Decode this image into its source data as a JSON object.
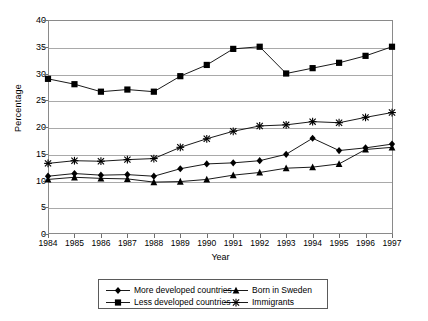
{
  "chart_data": {
    "type": "line",
    "title": "",
    "xlabel": "Year",
    "ylabel": "Percentage",
    "categories": [
      "1984",
      "1985",
      "1986",
      "1987",
      "1988",
      "1989",
      "1990",
      "1991",
      "1992",
      "1993",
      "1994",
      "1995",
      "1996",
      "1997"
    ],
    "ylim": [
      0,
      40
    ],
    "ytick_values": [
      0,
      5,
      10,
      15,
      20,
      25,
      30,
      35,
      40
    ],
    "ytick_labels": [
      "0",
      "5",
      "10",
      "15",
      "20",
      "25",
      "30",
      "35",
      "40"
    ],
    "grid": true,
    "legend_position": "bottom",
    "series": [
      {
        "name": "More developed countries",
        "marker": "diamond",
        "values": [
          10.8,
          11.3,
          11.0,
          11.1,
          10.8,
          12.2,
          13.1,
          13.3,
          13.7,
          14.9,
          17.9,
          15.6,
          16.1,
          16.8
        ]
      },
      {
        "name": "Less developed countries",
        "marker": "square",
        "values": [
          29.0,
          28.0,
          26.6,
          27.0,
          26.6,
          29.5,
          31.6,
          34.6,
          35.0,
          30.0,
          31.0,
          32.0,
          33.3,
          35.0
        ]
      },
      {
        "name": "Born in Sweden",
        "marker": "triangle",
        "values": [
          10.2,
          10.6,
          10.4,
          10.3,
          9.7,
          9.8,
          10.2,
          11.0,
          11.5,
          12.3,
          12.5,
          13.1,
          15.8,
          16.2
        ]
      },
      {
        "name": "Immigrants",
        "marker": "cross-x",
        "values": [
          13.2,
          13.7,
          13.6,
          13.9,
          14.1,
          16.2,
          17.8,
          19.2,
          20.2,
          20.4,
          21.0,
          20.8,
          21.8,
          22.7
        ]
      }
    ]
  },
  "colors": {
    "series": "#000000",
    "gridline": "#a9a9a9",
    "axis": "#8a8a8a",
    "background": "#ffffff"
  }
}
